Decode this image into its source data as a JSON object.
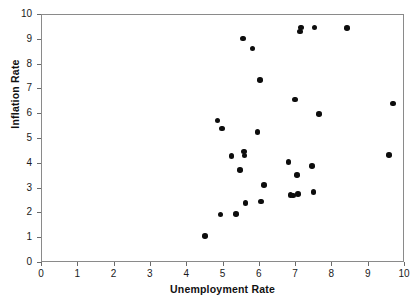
{
  "chart_data": {
    "type": "scatter",
    "title": "",
    "xlabel": "Unemployment Rate",
    "ylabel": "Inflation Rate",
    "xlim": [
      0,
      10
    ],
    "ylim": [
      0,
      10
    ],
    "xticks": [
      0,
      1,
      2,
      3,
      4,
      5,
      6,
      7,
      8,
      9,
      10
    ],
    "yticks": [
      0,
      1,
      2,
      3,
      4,
      5,
      6,
      7,
      8,
      9,
      10
    ],
    "xtick_labels": [
      "0",
      "1",
      "2",
      "3",
      "4",
      "5",
      "6",
      "7",
      "8",
      "9",
      "10"
    ],
    "ytick_labels": [
      "0",
      "1",
      "2",
      "3",
      "4",
      "5",
      "6",
      "7",
      "8",
      "9",
      "10"
    ],
    "grid": false,
    "legend": null,
    "marker": "filled-circle",
    "marker_color": "#0d0d0d",
    "frame_color": "#8a8a8a",
    "points": [
      {
        "x": 4.51,
        "y": 1.04
      },
      {
        "x": 4.86,
        "y": 5.71
      },
      {
        "x": 4.94,
        "y": 1.92
      },
      {
        "x": 4.99,
        "y": 5.39
      },
      {
        "x": 5.25,
        "y": 4.28
      },
      {
        "x": 5.38,
        "y": 1.93
      },
      {
        "x": 5.49,
        "y": 3.72
      },
      {
        "x": 5.57,
        "y": 9.02
      },
      {
        "x": 5.6,
        "y": 4.45
      },
      {
        "x": 5.61,
        "y": 4.29
      },
      {
        "x": 5.63,
        "y": 2.38
      },
      {
        "x": 5.83,
        "y": 8.61
      },
      {
        "x": 5.96,
        "y": 5.23
      },
      {
        "x": 6.03,
        "y": 7.33
      },
      {
        "x": 6.06,
        "y": 2.44
      },
      {
        "x": 6.15,
        "y": 3.11
      },
      {
        "x": 6.82,
        "y": 4.03
      },
      {
        "x": 6.87,
        "y": 2.71
      },
      {
        "x": 6.95,
        "y": 2.68
      },
      {
        "x": 7.0,
        "y": 6.55
      },
      {
        "x": 7.05,
        "y": 3.51
      },
      {
        "x": 7.08,
        "y": 2.73
      },
      {
        "x": 7.13,
        "y": 9.3
      },
      {
        "x": 7.17,
        "y": 9.46
      },
      {
        "x": 7.47,
        "y": 3.86
      },
      {
        "x": 7.51,
        "y": 2.82
      },
      {
        "x": 7.53,
        "y": 9.46
      },
      {
        "x": 7.66,
        "y": 5.96
      },
      {
        "x": 8.43,
        "y": 9.43
      },
      {
        "x": 9.58,
        "y": 4.31
      },
      {
        "x": 9.7,
        "y": 6.39
      }
    ]
  }
}
